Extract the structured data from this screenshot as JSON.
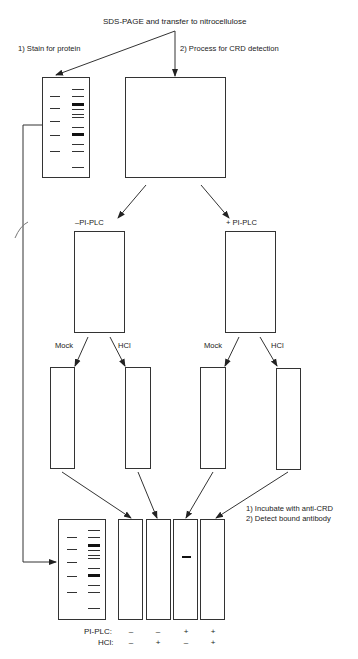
{
  "title": "SDS-PAGE and transfer to nitrocellulose",
  "branches": {
    "stain": "1) Stain for protein",
    "process": "2) Process for CRD detection"
  },
  "treatment": {
    "minus": "–PI-PLC",
    "plus": "+ PI-PLC"
  },
  "subtreatment": {
    "mock_left": "Mock",
    "hcl_left": "HCl",
    "mock_right": "Mock",
    "hcl_right": "HCl"
  },
  "final_steps": {
    "step1": "1) Incubate with anti-CRD",
    "step2": "2) Detect bound antibody"
  },
  "conditions": {
    "row1_label": "PI-PLC:",
    "row2_label": "HCl:",
    "pi_plc": [
      "–",
      "–",
      "+",
      "+"
    ],
    "hcl": [
      "–",
      "+",
      "–",
      "+"
    ]
  },
  "colors": {
    "line": "#333333",
    "band": "#222222",
    "background": "#ffffff"
  }
}
